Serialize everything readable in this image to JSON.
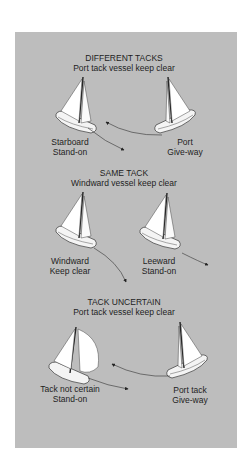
{
  "diagram": {
    "background_color": "#bdbdbd",
    "sections": [
      {
        "title": "DIFFERENT TACKS",
        "subtitle": "Port tack vessel keep clear",
        "left_boat": {
          "label_line1": "Starboard",
          "label_line2": "Stand-on"
        },
        "right_boat": {
          "label_line1": "Port",
          "label_line2": "Give-way"
        }
      },
      {
        "title": "SAME TACK",
        "subtitle": "Windward vessel keep clear",
        "left_boat": {
          "label_line1": "Windward",
          "label_line2": "Keep clear"
        },
        "right_boat": {
          "label_line1": "Leeward",
          "label_line2": "Stand-on"
        }
      },
      {
        "title": "TACK UNCERTAIN",
        "subtitle": "Port tack vessel keep clear",
        "left_boat": {
          "label_line1": "Tack not certain",
          "label_line2": "Stand-on"
        },
        "right_boat": {
          "label_line1": "Port tack",
          "label_line2": "Give-way"
        }
      }
    ]
  }
}
